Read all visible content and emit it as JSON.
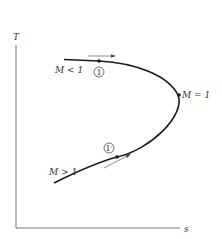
{
  "diagram": {
    "type": "T-s diagram (Fanno line)",
    "axes": {
      "y_label": "T",
      "x_label": "s"
    },
    "curve_labels": {
      "subsonic": "M < 1",
      "sonic": "M = 1",
      "supersonic": "M > 1"
    },
    "points": {
      "state1": "1",
      "state1_prime": "1′"
    },
    "colors": {
      "curve": "#1a1a1a",
      "axes": "#555555",
      "text": "#333333"
    }
  }
}
